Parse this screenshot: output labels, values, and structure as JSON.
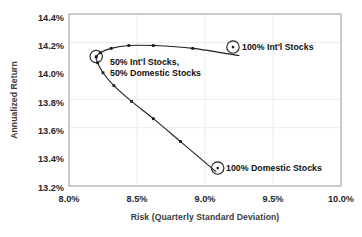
{
  "chart_data": {
    "type": "line",
    "title": "",
    "subtitle": "",
    "xlabel": "Risk (Quarterly Standard Deviation)",
    "ylabel": "Annualized Return",
    "xlim": [
      8.0,
      10.0
    ],
    "ylim": [
      13.2,
      14.4
    ],
    "xticks": [
      "8.0%",
      "8.5%",
      "9.0%",
      "9.5%",
      "10.0%"
    ],
    "xtick_values": [
      8.0,
      8.5,
      9.0,
      9.5,
      10.0
    ],
    "yticks": [
      "13.2%",
      "13.4%",
      "13.6%",
      "13.8%",
      "14.0%",
      "14.2%",
      "14.4%"
    ],
    "ytick_values": [
      13.2,
      13.4,
      13.6,
      13.8,
      14.0,
      14.2,
      14.4
    ],
    "grid": "both-faint",
    "legend": "none",
    "series": [
      {
        "name": "Efficient frontier (Int'l / Domestic stock mixes)",
        "x": [
          9.25,
          8.91,
          8.62,
          8.44,
          8.31,
          8.23,
          8.2,
          8.21,
          8.25,
          8.33,
          8.46,
          8.62,
          8.82,
          9.08
        ],
        "y": [
          14.11,
          14.16,
          14.18,
          14.18,
          14.16,
          14.13,
          14.1,
          14.06,
          13.99,
          13.9,
          13.79,
          13.67,
          13.51,
          13.3
        ],
        "markers": true
      }
    ],
    "annotations": [
      {
        "label": "100% Int'l Stocks",
        "point_x": 9.25,
        "point_y": 14.11,
        "circled": true,
        "label_position": "right"
      },
      {
        "label_line1": "50% Int'l Stocks,",
        "label_line2": "50% Domestic Stocks",
        "label": "50% Int'l Stocks, 50% Domestic Stocks",
        "point_x": 8.2,
        "point_y": 14.1,
        "circled": true,
        "label_position": "right"
      },
      {
        "label": "100% Domestic Stocks",
        "point_x": 9.08,
        "point_y": 13.3,
        "circled": true,
        "label_position": "right"
      }
    ]
  }
}
